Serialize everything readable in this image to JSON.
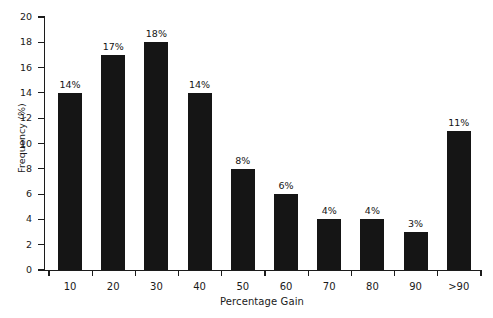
{
  "chart_data": {
    "type": "bar",
    "title": "",
    "xlabel": "Percentage Gain",
    "ylabel": "Frequency (%)",
    "categories": [
      "10",
      "20",
      "30",
      "40",
      "50",
      "60",
      "70",
      "80",
      "90",
      ">90"
    ],
    "values": [
      14,
      17,
      18,
      14,
      8,
      6,
      4,
      4,
      3,
      11
    ],
    "data_labels": [
      "14%",
      "17%",
      "18%",
      "14%",
      "8%",
      "6%",
      "4%",
      "4%",
      "3%",
      "11%"
    ],
    "ylim": [
      0,
      20
    ],
    "ytick_labels": [
      "0",
      "2",
      "4",
      "6",
      "8",
      "10",
      "12",
      "14",
      "16",
      "18",
      "20"
    ],
    "ytick_values": [
      0,
      2,
      4,
      6,
      8,
      10,
      12,
      14,
      16,
      18,
      20
    ],
    "grid": false,
    "legend": null,
    "bar_color": "#151515",
    "axis_color": "#1c1c1c",
    "background_color": "#ffffff"
  }
}
